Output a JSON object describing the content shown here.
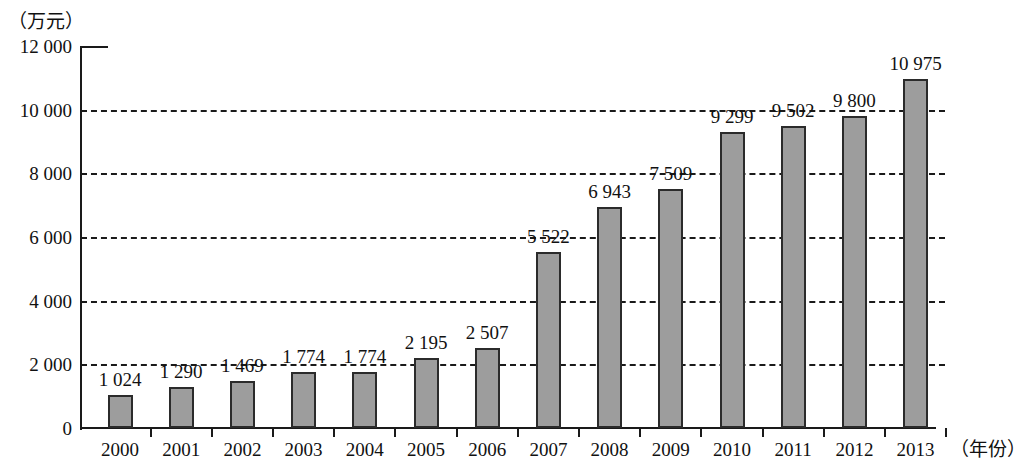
{
  "chart_data": {
    "type": "bar",
    "title": "",
    "subtitle": "",
    "xlabel": "（年份）",
    "ylabel": "（万元）",
    "categories": [
      "2000",
      "2001",
      "2002",
      "2003",
      "2004",
      "2005",
      "2006",
      "2007",
      "2008",
      "2009",
      "2010",
      "2011",
      "2012",
      "2013"
    ],
    "values": [
      1024,
      1290,
      1469,
      1774,
      1774,
      2195,
      2507,
      5522,
      6943,
      7509,
      9299,
      9502,
      9800,
      10975
    ],
    "value_labels": [
      "1 024",
      "1 290",
      "1 469",
      "1 774",
      "1 774",
      "2 195",
      "2 507",
      "5 522",
      "6 943",
      "7 509",
      "9 299",
      "9 502",
      "9 800",
      "10 975"
    ],
    "ylim": [
      0,
      12000
    ],
    "ytick_values": [
      0,
      2000,
      4000,
      6000,
      8000,
      10000,
      12000
    ],
    "ytick_labels": [
      "0",
      "2 000",
      "4 000",
      "6 000",
      "8 000",
      "10 000",
      "12 000"
    ],
    "grid": "horizontal-dashed",
    "gridlines_at": [
      2000,
      4000,
      6000,
      8000,
      10000
    ],
    "legend": [],
    "series": [
      {
        "name": "",
        "values": [
          1024,
          1290,
          1469,
          1774,
          1774,
          2195,
          2507,
          5522,
          6943,
          7509,
          9299,
          9502,
          9800,
          10975
        ]
      }
    ],
    "colors": {
      "bar_fill": "#9d9d9d",
      "bar_border": "#2b2b2b",
      "axis": "#1a1a1a",
      "grid": "#1a1a1a",
      "text": "#111111",
      "background": "#ffffff"
    }
  }
}
